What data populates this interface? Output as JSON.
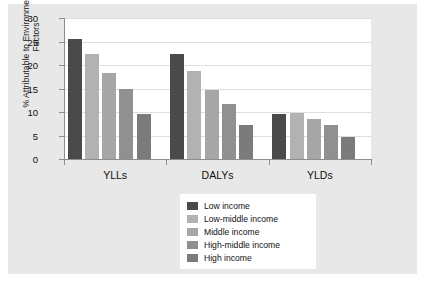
{
  "chart_data": {
    "type": "bar",
    "title": "",
    "subtitle": "",
    "xlabel": "",
    "ylabel": "% Attributable to Environmental Risk Factors",
    "categories": [
      "YLLs",
      "DALYs",
      "YLDs"
    ],
    "ylim": [
      0,
      30
    ],
    "yticks": [
      0,
      5,
      10,
      15,
      20,
      25,
      30
    ],
    "ytick_labels": [
      "0",
      "5",
      "10",
      "15",
      "20",
      "25",
      "30"
    ],
    "grid": true,
    "legend_position": "bottom-center",
    "series": [
      {
        "name": "Low income",
        "color": "#4a4a4a",
        "values": [
          25.5,
          22.3,
          9.5
        ]
      },
      {
        "name": "Low-middle income",
        "color": "#b2b2b2",
        "values": [
          22.4,
          18.8,
          9.7
        ]
      },
      {
        "name": "Middle income",
        "color": "#a6a6a6",
        "values": [
          18.2,
          14.7,
          8.5
        ]
      },
      {
        "name": "High-middle income",
        "color": "#909090",
        "values": [
          14.8,
          11.7,
          7.2
        ]
      },
      {
        "name": "High income",
        "color": "#7b7b7b",
        "values": [
          9.5,
          7.3,
          4.7
        ]
      }
    ]
  },
  "figure": {
    "panel_color": "#e8e8e8",
    "plot_background": "#ffffff",
    "axis_color": "#8d8d8d",
    "grid_color": "#dedede",
    "text_color": "#111111"
  }
}
